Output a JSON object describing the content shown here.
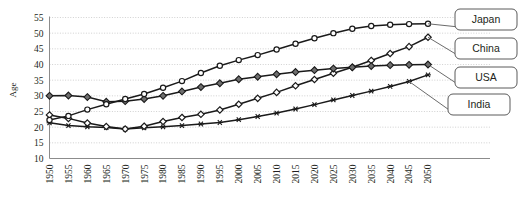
{
  "chart_data": {
    "type": "line",
    "title": "",
    "xlabel": "",
    "ylabel": "Age",
    "xlim": [
      1950,
      2050
    ],
    "ylim": [
      10,
      55
    ],
    "ytick_step": 5,
    "grid": true,
    "legend_position": "right-callouts",
    "x": [
      1950,
      1955,
      1960,
      1965,
      1970,
      1975,
      1980,
      1985,
      1990,
      1995,
      2000,
      2005,
      2010,
      2015,
      2020,
      2025,
      2030,
      2035,
      2040,
      2045,
      2050
    ],
    "yticks": [
      10,
      15,
      20,
      25,
      30,
      35,
      40,
      45,
      50,
      55
    ],
    "xticks": [
      "1950",
      "1955",
      "1960",
      "1965",
      "1970",
      "1975",
      "1980",
      "1985",
      "1990",
      "1995",
      "2000",
      "2005",
      "2010",
      "2015",
      "2020",
      "2025",
      "2030",
      "2035",
      "2040",
      "2045",
      "2050"
    ],
    "series": [
      {
        "name": "Japan",
        "marker": "open-circle",
        "values": [
          22.3,
          23.6,
          25.6,
          27.3,
          29.0,
          30.6,
          32.6,
          34.7,
          37.3,
          39.6,
          41.4,
          43.0,
          44.8,
          46.6,
          48.4,
          50.0,
          51.4,
          52.3,
          52.7,
          52.9,
          53.0
        ]
      },
      {
        "name": "China",
        "marker": "open-diamond",
        "values": [
          23.9,
          22.8,
          21.3,
          20.2,
          19.4,
          20.3,
          21.8,
          23.1,
          24.1,
          25.5,
          27.3,
          29.2,
          31.1,
          33.2,
          35.2,
          37.2,
          39.1,
          41.3,
          43.5,
          45.7,
          48.7
        ]
      },
      {
        "name": "USA",
        "marker": "filled-diamond",
        "values": [
          30.0,
          30.1,
          29.6,
          28.1,
          28.3,
          29.0,
          30.0,
          31.4,
          32.8,
          34.0,
          35.3,
          36.1,
          36.9,
          37.6,
          38.2,
          38.7,
          39.1,
          39.5,
          39.8,
          39.9,
          40.0
        ]
      },
      {
        "name": "India",
        "marker": "asterisk",
        "values": [
          21.4,
          20.5,
          20.1,
          19.9,
          19.4,
          19.8,
          20.1,
          20.5,
          21.0,
          21.5,
          22.4,
          23.4,
          24.5,
          25.8,
          27.2,
          28.7,
          30.1,
          31.5,
          33.0,
          34.6,
          36.7
        ]
      }
    ],
    "callouts": [
      {
        "label": "Japan"
      },
      {
        "label": "China"
      },
      {
        "label": "USA"
      },
      {
        "label": "India"
      }
    ]
  }
}
